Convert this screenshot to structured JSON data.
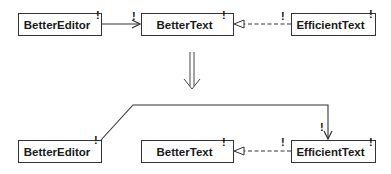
{
  "diagram": {
    "before": {
      "nodes": [
        {
          "id": "better-editor",
          "label": "BetterEditor",
          "marker": "!"
        },
        {
          "id": "better-text",
          "label": "BetterText",
          "marker": "!"
        },
        {
          "id": "efficient-text",
          "label": "EfficientText",
          "marker": "!"
        }
      ],
      "edges": [
        {
          "from": "BetterEditor",
          "to": "BetterText",
          "type": "association",
          "end_marker": "!"
        },
        {
          "from": "EfficientText",
          "to": "BetterText",
          "type": "realization",
          "end_marker": "!"
        }
      ]
    },
    "transition": {
      "symbol": "double-down-arrow"
    },
    "after": {
      "nodes": [
        {
          "id": "better-editor",
          "label": "BetterEditor",
          "marker": "!"
        },
        {
          "id": "better-text",
          "label": "BetterText",
          "marker": "!"
        },
        {
          "id": "efficient-text",
          "label": "EfficientText",
          "marker": "!"
        }
      ],
      "edges": [
        {
          "from": "BetterEditor",
          "to": "EfficientText",
          "type": "association",
          "end_marker": "!"
        },
        {
          "from": "EfficientText",
          "to": "BetterText",
          "type": "realization",
          "end_marker": "!"
        }
      ]
    },
    "colors": {
      "line": "#333333",
      "text": "#1a1a1a",
      "background": "#ffffff"
    }
  }
}
